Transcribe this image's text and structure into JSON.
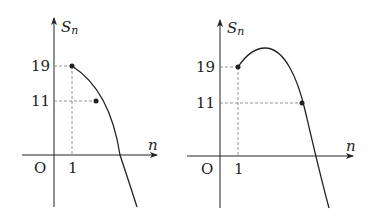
{
  "graphs": [
    {
      "y_label": "S",
      "y_label_sub": "n",
      "x_label": "n",
      "origin_label": "O",
      "x_tick": "1",
      "y_ticks": [
        "19",
        "11"
      ],
      "description": "Decreasing curve starting at (1,19), passing through a point at height 11, crossing the n-axis"
    },
    {
      "y_label": "S",
      "y_label_sub": "n",
      "x_label": "n",
      "origin_label": "O",
      "x_tick": "1",
      "y_ticks": [
        "19",
        "11"
      ],
      "description": "Curve starting at (1,19), rising to a maximum, then decreasing through height 11 and crossing the n-axis"
    }
  ],
  "colors": {
    "stroke": "#222222",
    "dash": "#777777"
  }
}
